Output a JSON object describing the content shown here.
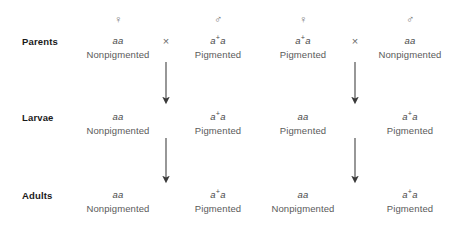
{
  "diagram": {
    "symbols": {
      "female": "♀",
      "male": "♂",
      "cross": "×"
    },
    "colors": {
      "background": "#ffffff",
      "row_label": "#1a1a1a",
      "genotype": "#4a4a4a",
      "phenotype": "#5a5a5a",
      "symbol": "#6b6b6b",
      "arrow": "#3a3a3a"
    },
    "row_labels": [
      {
        "id": "parents",
        "label": "Parents"
      },
      {
        "id": "larvae",
        "label": "Larvae"
      },
      {
        "id": "adults",
        "label": "Adults"
      }
    ],
    "sex_headers": [
      {
        "id": "cross-a-female",
        "symbol": "♀"
      },
      {
        "id": "cross-a-male",
        "symbol": "♂"
      },
      {
        "id": "cross-b-female",
        "symbol": "♀"
      },
      {
        "id": "cross-b-male",
        "symbol": "♂"
      }
    ],
    "cross_signs": [
      {
        "id": "cross-a-sign",
        "symbol": "×"
      },
      {
        "id": "cross-b-sign",
        "symbol": "×"
      }
    ],
    "parents": [
      {
        "id": "cross-a-mother",
        "allele1": "a",
        "superscript": "",
        "allele2": "a",
        "phenotype": "Nonpigmented"
      },
      {
        "id": "cross-a-father",
        "allele1": "a",
        "superscript": "+",
        "allele2": "a",
        "phenotype": "Pigmented"
      },
      {
        "id": "cross-b-mother",
        "allele1": "a",
        "superscript": "+",
        "allele2": "a",
        "phenotype": "Pigmented"
      },
      {
        "id": "cross-b-father",
        "allele1": "a",
        "superscript": "",
        "allele2": "a",
        "phenotype": "Nonpigmented"
      }
    ],
    "larvae": [
      {
        "id": "cross-a-larva-1",
        "allele1": "a",
        "superscript": "",
        "allele2": "a",
        "phenotype": "Nonpigmented"
      },
      {
        "id": "cross-a-larva-2",
        "allele1": "a",
        "superscript": "+",
        "allele2": "a",
        "phenotype": "Pigmented"
      },
      {
        "id": "cross-b-larva-1",
        "allele1": "a",
        "superscript": "",
        "allele2": "a",
        "phenotype": "Pigmented"
      },
      {
        "id": "cross-b-larva-2",
        "allele1": "a",
        "superscript": "+",
        "allele2": "a",
        "phenotype": "Pigmented"
      }
    ],
    "adults": [
      {
        "id": "cross-a-adult-1",
        "allele1": "a",
        "superscript": "",
        "allele2": "a",
        "phenotype": "Nonpigmented"
      },
      {
        "id": "cross-a-adult-2",
        "allele1": "a",
        "superscript": "+",
        "allele2": "a",
        "phenotype": "Pigmented"
      },
      {
        "id": "cross-b-adult-1",
        "allele1": "a",
        "superscript": "",
        "allele2": "a",
        "phenotype": "Nonpigmented"
      },
      {
        "id": "cross-b-adult-2",
        "allele1": "a",
        "superscript": "+",
        "allele2": "a",
        "phenotype": "Pigmented"
      }
    ],
    "arrows": [
      {
        "id": "arrow-cross-a-parents-to-larvae",
        "x": 166,
        "y1": 62,
        "y2": 104
      },
      {
        "id": "arrow-cross-a-larvae-to-adults",
        "x": 166,
        "y1": 138,
        "y2": 183
      },
      {
        "id": "arrow-cross-b-parents-to-larvae",
        "x": 355,
        "y1": 62,
        "y2": 104
      },
      {
        "id": "arrow-cross-b-larvae-to-adults",
        "x": 355,
        "y1": 138,
        "y2": 183
      }
    ],
    "layout": {
      "column_x": [
        118,
        218,
        303,
        410
      ],
      "cross_sign_x": [
        166,
        355
      ],
      "row_y": {
        "sex": 20,
        "parents": 41,
        "larvae": 117,
        "adults": 195
      },
      "label_x": 22
    }
  }
}
